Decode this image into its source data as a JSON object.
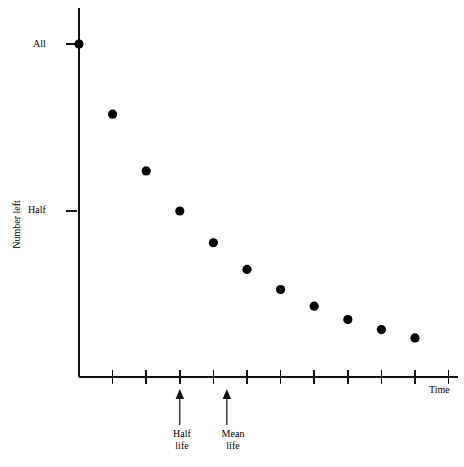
{
  "chart_data": {
    "type": "scatter",
    "title": "",
    "xlabel": "Time",
    "ylabel": "Number left",
    "grid": false,
    "legend": null,
    "x": [
      0,
      1,
      2,
      3,
      4,
      5,
      6,
      7,
      8,
      9,
      10
    ],
    "values": [
      1.0,
      0.79,
      0.62,
      0.5,
      0.405,
      0.325,
      0.265,
      0.215,
      0.175,
      0.145,
      0.12
    ],
    "y_tick_labels": [
      "All",
      "Half"
    ],
    "y_tick_values": [
      1.0,
      0.5
    ],
    "x_tick_count": 11,
    "annotations": [
      {
        "label": "Half\nlife",
        "x": 3,
        "kind": "arrow-up"
      },
      {
        "label": "Mean\nlife",
        "x": 4.4,
        "kind": "arrow-up"
      }
    ],
    "axis_labels": {
      "y_all": "All",
      "y_half": "Half",
      "y_axis_title": "Number left",
      "x_axis_title": "Time"
    }
  },
  "labels": {
    "all": "All",
    "half": "Half",
    "number_left": "Number left",
    "time": "Time",
    "half_life_line1": "Half",
    "half_life_line2": "life",
    "mean_life_line1": "Mean",
    "mean_life_line2": "life"
  },
  "colors": {
    "ink": "#000000",
    "axis": "#111111",
    "background": "#ffffff"
  }
}
